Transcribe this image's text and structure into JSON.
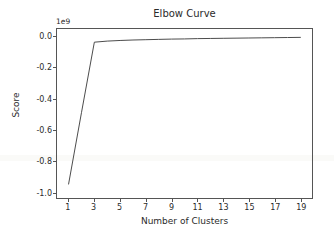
{
  "chart_data": {
    "type": "line",
    "title": "Elbow Curve",
    "xlabel": "Number of Clusters",
    "ylabel": "Score",
    "offset_text": "1e9",
    "grid": false,
    "legend": null,
    "xlim": [
      0.1,
      19.9
    ],
    "ylim": [
      -1.04,
      0.05
    ],
    "x_ticks": [
      1,
      3,
      5,
      7,
      9,
      11,
      13,
      15,
      17,
      19
    ],
    "x_tick_labels": [
      "1",
      "3",
      "5",
      "7",
      "9",
      "11",
      "13",
      "15",
      "17",
      "19"
    ],
    "y_ticks": [
      0.0,
      -0.2,
      -0.4,
      -0.6,
      -0.8,
      -1.0
    ],
    "y_tick_labels": [
      "0.0",
      "-0.2",
      "-0.4",
      "-0.6",
      "-0.8",
      "-1.0"
    ],
    "y_scale_note": "values expressed in units of 1e9",
    "line_color": "#4a4a4a",
    "line_width": 1,
    "x": [
      1,
      2,
      3,
      4,
      5,
      6,
      7,
      8,
      9,
      10,
      11,
      12,
      13,
      14,
      15,
      16,
      17,
      18,
      19
    ],
    "y": [
      -0.95,
      -0.49,
      -0.035,
      -0.028,
      -0.024,
      -0.021,
      -0.019,
      -0.017,
      -0.015,
      -0.014,
      -0.012,
      -0.011,
      -0.01,
      -0.009,
      -0.008,
      -0.007,
      -0.006,
      -0.005,
      -0.004
    ],
    "series": [
      {
        "name": "Score",
        "values": [
          -0.95,
          -0.49,
          -0.035,
          -0.028,
          -0.024,
          -0.021,
          -0.019,
          -0.017,
          -0.015,
          -0.014,
          -0.012,
          -0.011,
          -0.01,
          -0.009,
          -0.008,
          -0.007,
          -0.006,
          -0.005,
          -0.004
        ]
      }
    ]
  }
}
